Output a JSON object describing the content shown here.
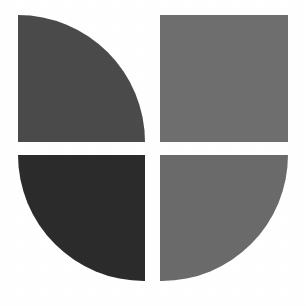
{
  "canvas": {
    "width": 306,
    "height": 306,
    "background_color": "#ffffff",
    "alt_text": "Four-tile abstract logo mark"
  },
  "logo": {
    "name": "quadrant-circle-mark",
    "description": "Abstract mark built from four grayscale quadrant tiles separated by a white cross gap",
    "gap": {
      "vertical_gap_px": 15,
      "horizontal_gap_px": 13,
      "center_x": 152,
      "center_y": 148
    },
    "quadrants": [
      {
        "id": "top-left",
        "label": "Top left quadrant",
        "color": "#4a4a4a",
        "shape": "quarter-round",
        "rounded_corner": "top-right",
        "x": 18,
        "y": 15,
        "width": 127,
        "height": 127
      },
      {
        "id": "top-right",
        "label": "Top right quadrant",
        "color": "#6e6e6e",
        "shape": "square",
        "rounded_corner": "none",
        "x": 160,
        "y": 15,
        "width": 128,
        "height": 127
      },
      {
        "id": "bottom-left",
        "label": "Bottom left quadrant",
        "color": "#2b2b2b",
        "shape": "quarter-round",
        "rounded_corner": "bottom-left",
        "x": 18,
        "y": 155,
        "width": 127,
        "height": 126
      },
      {
        "id": "bottom-right",
        "label": "Bottom right quadrant",
        "color": "#6a6a6a",
        "shape": "quarter-round",
        "rounded_corner": "bottom-right",
        "x": 160,
        "y": 155,
        "width": 128,
        "height": 126
      }
    ]
  }
}
